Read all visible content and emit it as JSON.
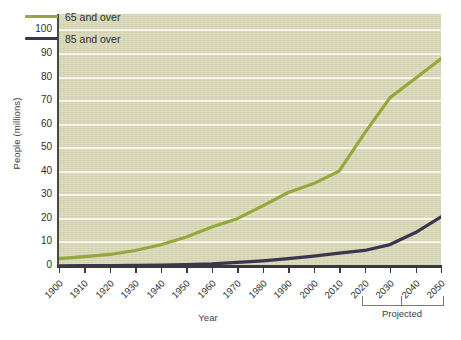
{
  "chart_data": {
    "type": "line",
    "title": "",
    "xlabel": "Year",
    "ylabel": "People (millions)",
    "xlim": [
      1900,
      2050
    ],
    "ylim": [
      0,
      107
    ],
    "yticks": [
      0,
      10,
      20,
      30,
      40,
      50,
      60,
      70,
      80,
      90,
      100
    ],
    "x": [
      1900,
      1910,
      1920,
      1930,
      1940,
      1950,
      1960,
      1970,
      1980,
      1990,
      2000,
      2010,
      2020,
      2030,
      2040,
      2050
    ],
    "xticklabels": [
      "1900",
      "1910",
      "1920",
      "1930",
      "1940",
      "1950",
      "1960",
      "1970",
      "1980",
      "1990",
      "2000",
      "2010",
      "2020",
      "2030",
      "2040",
      "2050"
    ],
    "grid": "horizontal",
    "legend_position": "top-left",
    "series": [
      {
        "name": "65 and over",
        "color": "#94a83c",
        "values": [
          3.1,
          4.0,
          4.9,
          6.6,
          9.0,
          12.3,
          16.6,
          20.1,
          25.5,
          31.2,
          35.0,
          40.3,
          56.4,
          71.5,
          79.7,
          88.0
        ]
      },
      {
        "name": "85 and over",
        "color": "#3a3550",
        "values": [
          0.1,
          0.2,
          0.2,
          0.3,
          0.4,
          0.6,
          0.9,
          1.5,
          2.2,
          3.1,
          4.2,
          5.5,
          6.6,
          9.1,
          14.2,
          20.9
        ]
      }
    ],
    "annotations": [
      {
        "text": "Projected",
        "span": [
          2020,
          2050
        ],
        "position": "below-axis"
      }
    ]
  },
  "legend": {
    "items": [
      {
        "label": "65 and over",
        "color": "#94a83c"
      },
      {
        "label": "85 and over",
        "color": "#3a3550"
      }
    ]
  },
  "axes": {
    "x_title": "Year",
    "y_title": "People (millions)"
  },
  "annotation": {
    "projected_label": "Projected"
  }
}
